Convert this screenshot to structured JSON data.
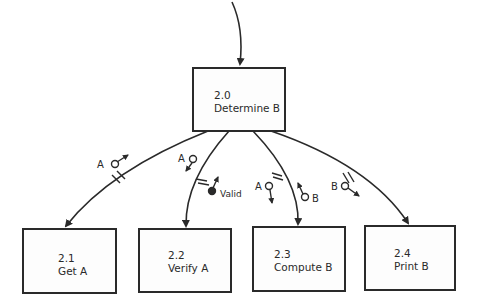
{
  "diagram": {
    "type": "structure-chart",
    "modules": [
      {
        "id": "2.0",
        "number": "2.0",
        "name": "Determine B"
      },
      {
        "id": "2.1",
        "number": "2.1",
        "name": "Get A"
      },
      {
        "id": "2.2",
        "number": "2.2",
        "name": "Verify A"
      },
      {
        "id": "2.3",
        "number": "2.3",
        "name": "Compute B"
      },
      {
        "id": "2.4",
        "number": "2.4",
        "name": "Print B"
      }
    ],
    "couples": [
      {
        "label": "A",
        "kind": "data",
        "from": "2.1",
        "to": "2.0"
      },
      {
        "label": "A",
        "kind": "data",
        "from": "2.0",
        "to": "2.2"
      },
      {
        "label": "Valid",
        "kind": "control",
        "from": "2.2",
        "to": "2.0"
      },
      {
        "label": "A",
        "kind": "data",
        "from": "2.0",
        "to": "2.3"
      },
      {
        "label": "B",
        "kind": "data",
        "from": "2.3",
        "to": "2.0"
      },
      {
        "label": "B",
        "kind": "data",
        "from": "2.0",
        "to": "2.4"
      }
    ]
  }
}
